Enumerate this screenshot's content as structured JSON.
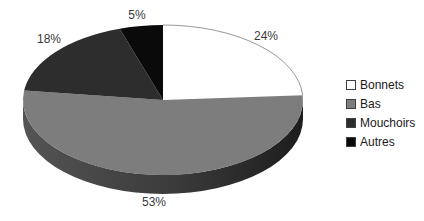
{
  "chart_data": {
    "type": "pie",
    "style": "3d-exploded-none",
    "title": "",
    "legend_position": "right",
    "direction": "clockwise",
    "start_angle_deg": 0,
    "slices": [
      {
        "label": "Bonnets",
        "value": 24,
        "pct_label": "24%",
        "color": "#ffffff",
        "outlined": true
      },
      {
        "label": "Bas",
        "value": 53,
        "pct_label": "53%",
        "color": "#7d7d7d",
        "outlined": false
      },
      {
        "label": "Mouchoirs",
        "value": 18,
        "pct_label": "18%",
        "color": "#2d2d2d",
        "outlined": false
      },
      {
        "label": "Autres",
        "value": 5,
        "pct_label": "5%",
        "color": "#0a0a0a",
        "outlined": false
      }
    ],
    "colors": {
      "background": "#ffffff",
      "outline": "#8c8c8c",
      "label_text": "#3a3a3a",
      "legend_text": "#1a1a1a",
      "swatch_border": "#3f3f3f",
      "side_left": "#545454",
      "side_mid": "#3a3a3a",
      "side_right": "#1d1d1d"
    }
  }
}
